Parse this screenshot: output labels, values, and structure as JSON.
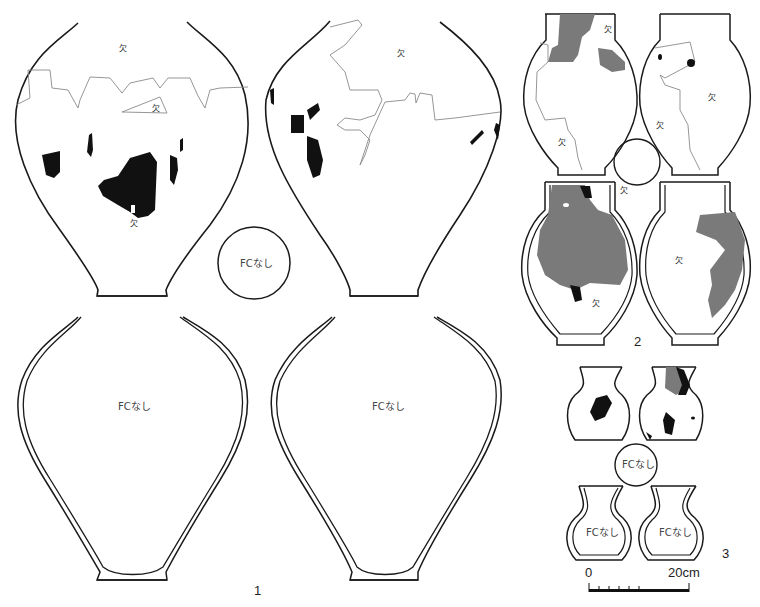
{
  "figure": {
    "groups": [
      {
        "number": "1",
        "vessels": [
          {
            "view": "exterior-left",
            "labels": [
              "欠",
              "欠",
              "欠"
            ]
          },
          {
            "view": "exterior-right",
            "labels": [
              "欠"
            ]
          },
          {
            "view": "interior-left",
            "labels": [
              "FCなし"
            ]
          },
          {
            "view": "interior-right",
            "labels": [
              "FCなし"
            ]
          }
        ],
        "base_label": "FCなし"
      },
      {
        "number": "2",
        "vessels": [
          {
            "view": "exterior-left",
            "labels": [
              "欠",
              "欠"
            ]
          },
          {
            "view": "exterior-right",
            "labels": [
              "欠",
              "欠"
            ]
          },
          {
            "view": "interior-left",
            "labels": [
              "欠"
            ]
          },
          {
            "view": "interior-right",
            "labels": [
              "欠"
            ]
          }
        ],
        "base_label": "欠"
      },
      {
        "number": "3",
        "vessels": [
          {
            "view": "exterior-left",
            "labels": []
          },
          {
            "view": "exterior-right",
            "labels": []
          },
          {
            "view": "interior-left",
            "labels": [
              "FCなし"
            ]
          },
          {
            "view": "interior-right",
            "labels": [
              "FCなし"
            ]
          }
        ],
        "base_label": "FCなし"
      }
    ],
    "labels": {
      "missing": "欠",
      "no_fire_cloud": "FCなし"
    },
    "scale": {
      "start": "0",
      "end": "20cm"
    },
    "colors": {
      "line": "#1a1a1a",
      "fire_cloud_black": "#111111",
      "fire_cloud_gray": "#7a7a7a",
      "break_line": "#8a8a8a"
    }
  }
}
